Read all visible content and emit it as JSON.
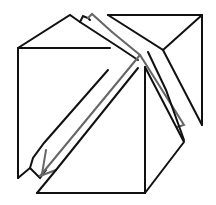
{
  "figure": {
    "title": "",
    "colors": {
      "background": "#ffffff",
      "primary_stroke": "#111111",
      "secondary_stroke": "#666666"
    },
    "shapes": [
      {
        "name": "left-box",
        "label": ""
      },
      {
        "name": "top-right-triangle",
        "label": ""
      },
      {
        "name": "bottom-prism",
        "label": ""
      },
      {
        "name": "diagonal-strips",
        "label": ""
      }
    ]
  }
}
